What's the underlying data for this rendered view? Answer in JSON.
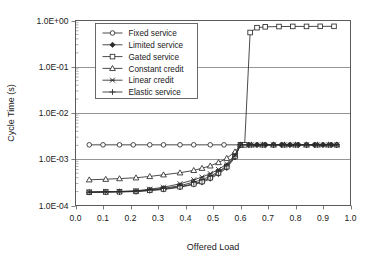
{
  "chart_data": {
    "type": "line",
    "title": "",
    "xlabel": "Offered Load",
    "ylabel": "Cycle Time (s)",
    "xlim": [
      0.0,
      1.0
    ],
    "ylim": [
      0.0001,
      1.0
    ],
    "yscale": "log",
    "xscale": "linear",
    "grid": "horizontal-major",
    "legend_position": "upper-left-inside",
    "xticks": [
      "0.0",
      "0.1",
      "0.2",
      "0.3",
      "0.4",
      "0.5",
      "0.6",
      "0.7",
      "0.8",
      "0.9",
      "1.0"
    ],
    "xtick_values": [
      0.0,
      0.1,
      0.2,
      0.3,
      0.4,
      0.5,
      0.6,
      0.7,
      0.8,
      0.9,
      1.0
    ],
    "yticks": [
      "1.0E+00",
      "1.0E-01",
      "1.0E-02",
      "1.0E-03",
      "1.0E-04"
    ],
    "ytick_values": [
      1.0,
      0.1,
      0.01,
      0.001,
      0.0001
    ],
    "series": [
      {
        "name": "Fixed service",
        "marker": "circle-open",
        "x": [
          0.05,
          0.1,
          0.16,
          0.21,
          0.27,
          0.32,
          0.38,
          0.43,
          0.49,
          0.54,
          0.6,
          0.63,
          0.66,
          0.69,
          0.72,
          0.75,
          0.78,
          0.81,
          0.84,
          0.87,
          0.9,
          0.93,
          0.95
        ],
        "y": [
          0.00205,
          0.00205,
          0.00205,
          0.00205,
          0.00205,
          0.00205,
          0.00205,
          0.00205,
          0.00205,
          0.00205,
          0.00205,
          0.00205,
          0.00205,
          0.00205,
          0.00205,
          0.00205,
          0.00205,
          0.00205,
          0.00205,
          0.00205,
          0.00205,
          0.00205,
          0.00205
        ]
      },
      {
        "name": "Limited service",
        "marker": "diamond-solid",
        "x": [
          0.05,
          0.11,
          0.16,
          0.22,
          0.27,
          0.32,
          0.38,
          0.43,
          0.46,
          0.49,
          0.52,
          0.55,
          0.58,
          0.6,
          0.63,
          0.66,
          0.69,
          0.72,
          0.75,
          0.78,
          0.81,
          0.84,
          0.87,
          0.9,
          0.93,
          0.95
        ],
        "y": [
          0.000193,
          0.000195,
          0.000197,
          0.0002,
          0.00021,
          0.000222,
          0.000248,
          0.000285,
          0.000315,
          0.00038,
          0.00048,
          0.00065,
          0.0011,
          0.00205,
          0.00205,
          0.00205,
          0.00205,
          0.00205,
          0.00205,
          0.00205,
          0.00205,
          0.00205,
          0.00205,
          0.00205,
          0.00205,
          0.00205
        ]
      },
      {
        "name": "Gated service",
        "marker": "square-open",
        "x": [
          0.05,
          0.11,
          0.16,
          0.22,
          0.27,
          0.32,
          0.38,
          0.43,
          0.46,
          0.49,
          0.52,
          0.55,
          0.58,
          0.6,
          0.615,
          0.635,
          0.66,
          0.69,
          0.74,
          0.79,
          0.84,
          0.89,
          0.94
        ],
        "y": [
          0.000193,
          0.000196,
          0.000198,
          0.000202,
          0.000213,
          0.000228,
          0.000255,
          0.000295,
          0.00033,
          0.0004,
          0.00051,
          0.00069,
          0.00115,
          0.00205,
          0.00205,
          0.55,
          0.7,
          0.73,
          0.74,
          0.745,
          0.745,
          0.748,
          0.748
        ]
      },
      {
        "name": "Constant credit",
        "marker": "triangle-open",
        "x": [
          0.05,
          0.11,
          0.16,
          0.22,
          0.27,
          0.32,
          0.38,
          0.43,
          0.46,
          0.49,
          0.52,
          0.55,
          0.58,
          0.6,
          0.64,
          0.68,
          0.72,
          0.76,
          0.8,
          0.84,
          0.88,
          0.92,
          0.95
        ],
        "y": [
          0.00036,
          0.00037,
          0.000382,
          0.000398,
          0.000425,
          0.000462,
          0.00051,
          0.000575,
          0.00064,
          0.00072,
          0.00085,
          0.00105,
          0.00145,
          0.00205,
          0.00205,
          0.00205,
          0.00205,
          0.00205,
          0.00205,
          0.00205,
          0.00205,
          0.00205,
          0.00205
        ]
      },
      {
        "name": "Linear credit",
        "marker": "star-x",
        "x": [
          0.05,
          0.11,
          0.16,
          0.22,
          0.27,
          0.32,
          0.38,
          0.43,
          0.46,
          0.49,
          0.52,
          0.55,
          0.58,
          0.6,
          0.64,
          0.68,
          0.72,
          0.76,
          0.8,
          0.84,
          0.88,
          0.92,
          0.95
        ],
        "y": [
          0.000196,
          0.000199,
          0.000202,
          0.000208,
          0.000225,
          0.000248,
          0.000295,
          0.00036,
          0.00041,
          0.00049,
          0.0006,
          0.00079,
          0.00125,
          0.00205,
          0.00205,
          0.00205,
          0.00205,
          0.00205,
          0.00205,
          0.00205,
          0.00205,
          0.00205,
          0.00205
        ]
      },
      {
        "name": "Elastic service",
        "marker": "plus",
        "x": [
          0.05,
          0.11,
          0.16,
          0.22,
          0.27,
          0.32,
          0.38,
          0.43,
          0.46,
          0.49,
          0.52,
          0.55,
          0.58,
          0.6,
          0.64,
          0.68,
          0.72,
          0.76,
          0.8,
          0.84,
          0.88,
          0.92,
          0.95
        ],
        "y": [
          0.000194,
          0.000197,
          0.000199,
          0.000204,
          0.000218,
          0.000235,
          0.000268,
          0.00032,
          0.00036,
          0.00043,
          0.00054,
          0.00072,
          0.00118,
          0.00205,
          0.00205,
          0.00205,
          0.00205,
          0.00205,
          0.00205,
          0.00205,
          0.00205,
          0.00205,
          0.00205
        ]
      }
    ],
    "legend": [
      {
        "label": "Fixed service",
        "marker": "circle-open"
      },
      {
        "label": "Limited service",
        "marker": "diamond-solid"
      },
      {
        "label": "Gated service",
        "marker": "square-open"
      },
      {
        "label": "Constant credit",
        "marker": "triangle-open"
      },
      {
        "label": "Linear credit",
        "marker": "star-x"
      },
      {
        "label": "Elastic service",
        "marker": "plus"
      }
    ],
    "colors": {
      "line": "#2b2b2b",
      "grid": "#8a8a8a",
      "frame": "#5a5a5a",
      "background": "#ffffff",
      "text": "#1a1a1a"
    }
  }
}
